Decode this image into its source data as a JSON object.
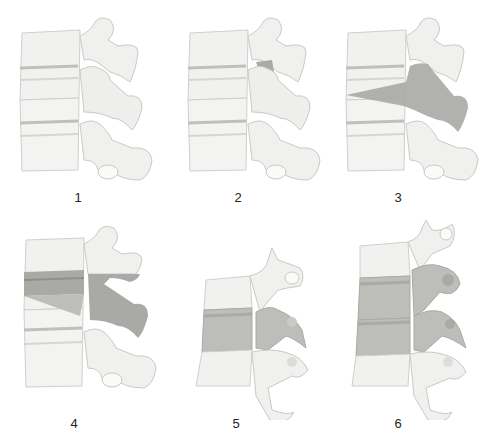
{
  "figure": {
    "colors": {
      "bone": "#f1f1ef",
      "bone_edge": "#c9c9c6",
      "bone_shadow": "#dcdcd9",
      "disc": "#e6e6e3",
      "shade": "#a9a9a6",
      "shade_light": "#bdbdba"
    },
    "panels": [
      {
        "id": "1",
        "label": "1",
        "shading": "none"
      },
      {
        "id": "2",
        "label": "2",
        "shading": "small-region-upper-facet"
      },
      {
        "id": "3",
        "label": "3",
        "shading": "wedge-through-body-and-posterior-elements"
      },
      {
        "id": "4",
        "label": "4",
        "shading": "disc-band-and-posterior-elements"
      },
      {
        "id": "5",
        "label": "5",
        "shading": "middle-vertebra-full"
      },
      {
        "id": "6",
        "label": "6",
        "shading": "two-middle-vertebrae-full"
      }
    ]
  }
}
